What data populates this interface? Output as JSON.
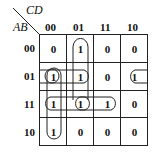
{
  "kmap": {
    "row_var": "AB",
    "col_var": "CD",
    "col_labels": [
      "00",
      "01",
      "11",
      "10"
    ],
    "row_labels": [
      "00",
      "01",
      "11",
      "10"
    ],
    "cells": [
      [
        "0",
        "1",
        "0",
        "0"
      ],
      [
        "1",
        "1",
        "0",
        "1"
      ],
      [
        "1",
        "1",
        "1",
        "0"
      ],
      [
        "1",
        "0",
        "0",
        "0"
      ]
    ]
  }
}
